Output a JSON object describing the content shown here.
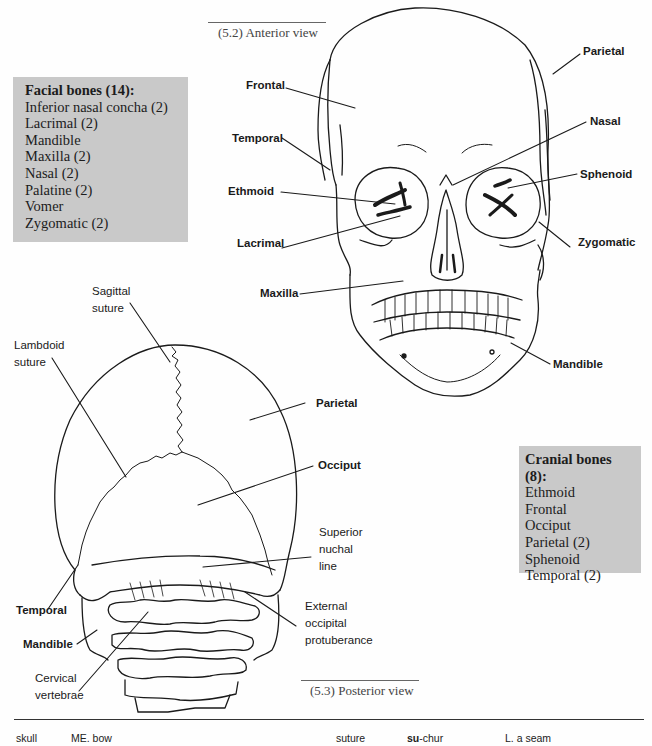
{
  "anterior_view": {
    "caption": "(5.2) Anterior view",
    "labels": {
      "frontal": "Frontal",
      "temporal": "Temporal",
      "ethmoid": "Ethmoid",
      "lacrimal": "Lacrimal",
      "maxilla": "Maxilla",
      "parietal": "Parietal",
      "nasal": "Nasal",
      "sphenoid": "Sphenoid",
      "zygomatic": "Zygomatic",
      "mandible": "Mandible"
    }
  },
  "posterior_view": {
    "caption": "(5.3) Posterior view",
    "labels": {
      "sagittal_suture_1": "Sagittal",
      "sagittal_suture_2": "suture",
      "lambdoid_suture_1": "Lambdoid",
      "lambdoid_suture_2": "suture",
      "parietal": "Parietal",
      "occiput": "Occiput",
      "superior_nuchal_line_1": "Superior",
      "superior_nuchal_line_2": "nuchal",
      "superior_nuchal_line_3": "line",
      "temporal": "Temporal",
      "mandible": "Mandible",
      "external_occipital_1": "External",
      "external_occipital_2": "occipital",
      "external_occipital_3": "protuberance",
      "cervical_vertebrae_1": "Cervical",
      "cervical_vertebrae_2": "vertebrae"
    }
  },
  "facial_bones_box": {
    "title": "Facial bones (14):",
    "items": [
      "Inferior nasal concha (2)",
      "Lacrimal (2)",
      "Mandible",
      "Maxilla (2)",
      "Nasal (2)",
      "Palatine (2)",
      "Vomer",
      "Zygomatic (2)"
    ]
  },
  "cranial_bones_box": {
    "title": "Cranial bones (8):",
    "items": [
      "Ethmoid",
      "Frontal",
      "Occiput",
      "Parietal (2)",
      "Sphenoid",
      "Temporal (2)"
    ]
  },
  "footer": {
    "term1": "skull",
    "term1_origin": "ME. bow",
    "term2": "suture",
    "term2_pron_bold": "su",
    "term2_pron_rest": "-chur",
    "term2_origin": "L. a seam"
  },
  "colors": {
    "box_background": "#c9c9c9",
    "line": "#1a1a1a",
    "caption_text": "#444444"
  }
}
